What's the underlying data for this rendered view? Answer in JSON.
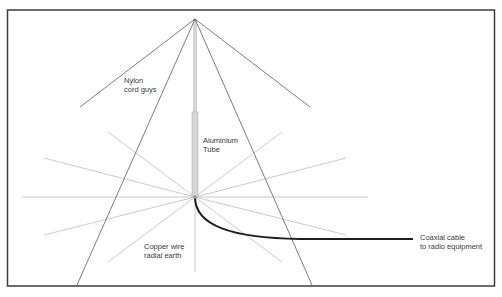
{
  "diagram": {
    "labels": {
      "guys": [
        "Nylon",
        "cord guys"
      ],
      "tube": [
        "Aluminium",
        "Tube"
      ],
      "radials": [
        "Copper wire",
        "radial earth"
      ],
      "coax": [
        "Coaxial cable",
        "to radio equipment"
      ]
    },
    "colors": {
      "border": "#3c3c3c",
      "guy": "#6e6e6e",
      "radial": "#c4c4c4",
      "tube_fill": "#d6d6d6",
      "tube_stroke": "#b4b4b4",
      "coax": "#1e1e1e",
      "text": "#3a3a3a"
    }
  }
}
